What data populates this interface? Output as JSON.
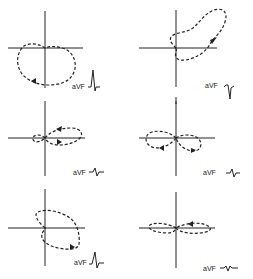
{
  "figure": {
    "type": "vectorcardiogram-loops",
    "layout": "3 rows x 2 columns",
    "panels": [
      {
        "id": 1,
        "row": 1,
        "col": 1,
        "lead_label": "aVF",
        "loop": "large clockwise loop inferior, mostly below horizontal axis",
        "arrow": "lower left",
        "ecg_complex": "upright R with small S"
      },
      {
        "id": 2,
        "row": 1,
        "col": 2,
        "lead_label": "aVF",
        "loop": "elongated loop superior-right, arrow pointing up-right",
        "arrow": "right side pointing up",
        "ecg_complex": "small r deep S"
      },
      {
        "id": 3,
        "row": 2,
        "col": 1,
        "lead_label": "aVF",
        "loop": "figure-eight, small left lobe, larger right lobe along horizontal axis",
        "arrow": "upper right lobe pointing left, lower pointing right",
        "ecg_complex": "small biphasic"
      },
      {
        "id": 4,
        "row": 2,
        "col": 2,
        "lead_label": "aVF",
        "loop": "figure-eight, left lobe above, right lobe below horizontal axis",
        "arrow": "lower portions",
        "ecg_complex": "small biphasic"
      },
      {
        "id": 5,
        "row": 3,
        "col": 1,
        "lead_label": "aVF",
        "loop": "oblique loop crossing origin, lower right",
        "arrow": "lower right",
        "ecg_complex": "upright R with S"
      },
      {
        "id": 6,
        "row": 3,
        "col": 2,
        "lead_label": "aVF",
        "loop": "flat horizontal loop along x axis",
        "arrow": "upper edge pointing left",
        "ecg_complex": "low amplitude triphasic"
      }
    ]
  }
}
